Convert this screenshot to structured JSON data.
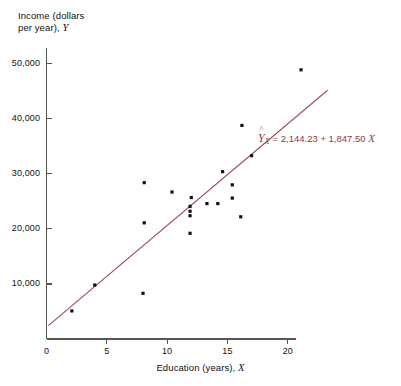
{
  "chart_data": {
    "type": "scatter",
    "title": "",
    "ylabel_line1": "Income (dollars",
    "ylabel_line2": "per year), ",
    "ylabel_var": "Y",
    "xlabel_text": "Education (years), ",
    "xlabel_var": "X",
    "xlim": [
      0,
      23.5
    ],
    "ylim": [
      0,
      52500
    ],
    "xticks": [
      0,
      5,
      10,
      15,
      20
    ],
    "xtick_labels": [
      "0",
      "5",
      "10",
      "15",
      "20"
    ],
    "yticks": [
      10000,
      20000,
      30000,
      40000,
      50000
    ],
    "ytick_labels": [
      "10,000",
      "20,000",
      "30,000",
      "40,000",
      "50,000"
    ],
    "grid": false,
    "legend": "none",
    "marker_color": "#111111",
    "line_color": "#9b4a58",
    "axis_color": "#555555",
    "points": [
      {
        "x": 2.1,
        "y": 5100
      },
      {
        "x": 4.0,
        "y": 9800
      },
      {
        "x": 8.0,
        "y": 8300
      },
      {
        "x": 8.1,
        "y": 21100
      },
      {
        "x": 8.1,
        "y": 28400
      },
      {
        "x": 10.4,
        "y": 26700
      },
      {
        "x": 11.9,
        "y": 19200
      },
      {
        "x": 11.9,
        "y": 22400
      },
      {
        "x": 11.9,
        "y": 23200
      },
      {
        "x": 11.9,
        "y": 24100
      },
      {
        "x": 12.0,
        "y": 25700
      },
      {
        "x": 13.3,
        "y": 24600
      },
      {
        "x": 14.2,
        "y": 24600
      },
      {
        "x": 14.6,
        "y": 30400
      },
      {
        "x": 15.4,
        "y": 28000
      },
      {
        "x": 15.4,
        "y": 25600
      },
      {
        "x": 16.1,
        "y": 22200
      },
      {
        "x": 16.2,
        "y": 38800
      },
      {
        "x": 17.0,
        "y": 33300
      },
      {
        "x": 21.1,
        "y": 48900
      }
    ],
    "regression": {
      "intercept": 2144.23,
      "slope": 1847.5,
      "x_start": 0.15,
      "x_end": 23.3,
      "equation_lhs": "Y",
      "equation_sub": "X",
      "equation_rhs": "=  2,144.23 + 1,847.50 ",
      "equation_xvar": "X"
    }
  }
}
